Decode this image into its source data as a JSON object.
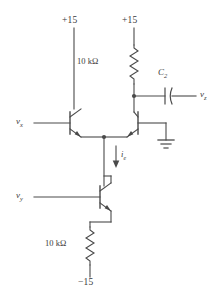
{
  "diagram": {
    "type": "circuit-schematic",
    "stroke_color": "#4a4a4a",
    "text_color": "#3a3a3a",
    "background": "#ffffff"
  },
  "supplies": {
    "left_rail": "+15",
    "right_rail": "+15",
    "negative_rail": "−15"
  },
  "components": {
    "collector_resistor": {
      "label": "10 kΩ",
      "designator": "",
      "symbol": "zigzag-resistor"
    },
    "emitter_resistor": {
      "label": "10 kΩ",
      "designator": "",
      "symbol": "zigzag-resistor"
    },
    "coupling_capacitor": {
      "label": "C",
      "subscript": "2",
      "symbol": "capacitor-plates"
    },
    "transistor_left": {
      "name": "Q1",
      "symbol": "npn-bjt"
    },
    "transistor_right": {
      "name": "Q2",
      "symbol": "npn-bjt"
    },
    "transistor_source": {
      "name": "Q3",
      "symbol": "npn-bjt"
    },
    "ground": {
      "symbol": "ground-symbol"
    }
  },
  "signals": {
    "input_x": {
      "label": "v",
      "subscript": "x"
    },
    "input_y": {
      "label": "v",
      "subscript": "y"
    },
    "output_z": {
      "label": "v",
      "subscript": "z"
    },
    "tail_current": {
      "label": "i",
      "subscript": "e",
      "direction": "down"
    }
  }
}
